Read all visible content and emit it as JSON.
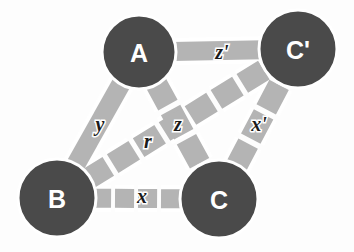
{
  "diagram": {
    "background_color": "#fdfdfd",
    "node_fill_color": "#4a4a4a",
    "node_outline_color": "#ffffff",
    "node_label_color": "#ffffff",
    "edge_color": "#b4b4b4",
    "edge_halo_color": "#ffffff",
    "edge_label_color": "#1a1a1a",
    "nodes": [
      {
        "id": "A",
        "label": "A",
        "cx": 139,
        "cy": 52,
        "r": 37
      },
      {
        "id": "Cp",
        "label": "C'",
        "cx": 298,
        "cy": 49,
        "r": 39
      },
      {
        "id": "B",
        "label": "B",
        "cx": 57,
        "cy": 198,
        "r": 39
      },
      {
        "id": "C",
        "label": "C",
        "cx": 219,
        "cy": 199,
        "r": 39
      }
    ],
    "edges": [
      {
        "id": "z-prime",
        "label": "z'",
        "from": "A",
        "to": "Cp",
        "style": "solid",
        "width": 19,
        "label_x": 222,
        "label_y": 52
      },
      {
        "id": "y",
        "label": "y",
        "from": "A",
        "to": "B",
        "style": "solid",
        "width": 19,
        "label_x": 100,
        "label_y": 124
      },
      {
        "id": "z",
        "label": "z",
        "from": "A",
        "to": "C",
        "style": "dashed",
        "width": 22,
        "label_x": 178,
        "label_y": 124
      },
      {
        "id": "r",
        "label": "r",
        "from": "B",
        "to": "Cp",
        "style": "dashed",
        "width": 22,
        "label_x": 148,
        "label_y": 141
      },
      {
        "id": "x",
        "label": "x",
        "from": "B",
        "to": "C",
        "style": "dashed",
        "width": 19,
        "label_x": 142,
        "label_y": 196
      },
      {
        "id": "x-prime",
        "label": "x'",
        "from": "C",
        "to": "Cp",
        "style": "dashed",
        "width": 22,
        "label_x": 259,
        "label_y": 124
      }
    ]
  }
}
